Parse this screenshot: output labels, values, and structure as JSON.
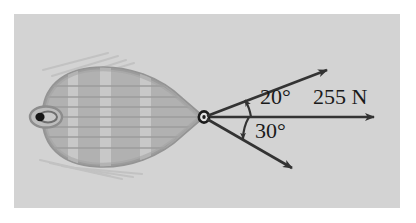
{
  "figure": {
    "kind": "physics-free-body-diagram",
    "panel_color": "#d3d3d3",
    "background_color": "#ffffff"
  },
  "labels": {
    "angle_upper": "20°",
    "angle_lower": "30°",
    "force_resultant": "255 N"
  },
  "vectors": [
    {
      "name": "upper-rope-vector",
      "angle_label": "20°",
      "direction": "up-right"
    },
    {
      "name": "resultant-vector",
      "angle_label": "",
      "direction": "right",
      "magnitude_label": "255 N"
    },
    {
      "name": "lower-rope-vector",
      "angle_label": "30°",
      "direction": "down-right"
    }
  ],
  "colors": {
    "ink": "#333333",
    "hull_fill": "#b4b4b4",
    "hull_edge": "#9a9a9a",
    "plank_line": "#a0a0a0",
    "bulkhead": "#c4c4c4",
    "oar": "#c6c6c6"
  },
  "boat": {
    "name": "barge-top-view",
    "bow_fitting": "tow-eyelet",
    "stern_fitting": "stern-ring"
  }
}
